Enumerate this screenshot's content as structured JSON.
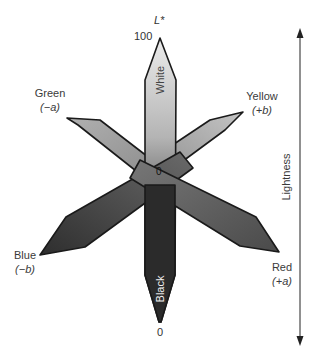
{
  "diagram": {
    "axis_label_top": "L*",
    "tick_top": "100",
    "tick_bottom": "0",
    "center_label": "0",
    "arms": {
      "white": {
        "label": "White"
      },
      "black": {
        "label": "Black"
      },
      "green": {
        "name": "Green",
        "axis": "(−a)"
      },
      "yellow": {
        "name": "Yellow",
        "axis": "(+b)"
      },
      "blue": {
        "name": "Blue",
        "axis": "(−b)"
      },
      "red": {
        "name": "Red",
        "axis": "(+a)"
      }
    },
    "lightness_arrow_label": "Lightness",
    "colors": {
      "outline": "#1a1a1a",
      "white_end": "#e6e6e6",
      "black_end": "#232323",
      "green_arm": "#8c8c8c",
      "yellow_arm": "#9a9a9a",
      "blue_arm": "#3c3c3c",
      "red_arm": "#5e5e5e"
    }
  }
}
